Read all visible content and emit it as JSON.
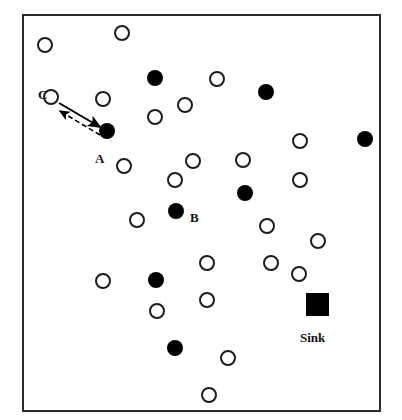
{
  "figure": {
    "kind": "sensor-network-diagram",
    "background_color": "#ffffff",
    "border_color": "#2b2b2b",
    "field": {
      "x": 22,
      "y": 14,
      "width": 359,
      "height": 398
    }
  },
  "legend_text": {
    "label_a": "A",
    "label_b": "B",
    "label_c": "C",
    "label_sink": "Sink"
  },
  "colors": {
    "sensor_fill": "#ffffff",
    "sensor_stroke": "#1c1c1c",
    "source_fill": "#000000",
    "sink_fill": "#000000",
    "link_solid": "#000000",
    "link_dashed": "#000000"
  },
  "chart_data": {
    "type": "scatter",
    "title": "",
    "xlabel": "",
    "ylabel": "",
    "xlim": [
      22,
      381
    ],
    "ylim": [
      14,
      412
    ],
    "grid": false,
    "legend_position": "none",
    "series": [
      {
        "name": "sensor-node",
        "marker": "open-circle",
        "radius": 8,
        "fill": "#ffffff",
        "stroke": "#1c1c1c",
        "points": [
          {
            "x": 45,
            "y": 45
          },
          {
            "x": 122,
            "y": 33
          },
          {
            "x": 51,
            "y": 97
          },
          {
            "x": 103,
            "y": 99
          },
          {
            "x": 155,
            "y": 117
          },
          {
            "x": 185,
            "y": 105
          },
          {
            "x": 217,
            "y": 79
          },
          {
            "x": 300,
            "y": 141
          },
          {
            "x": 124,
            "y": 166
          },
          {
            "x": 193,
            "y": 161
          },
          {
            "x": 243,
            "y": 160
          },
          {
            "x": 175,
            "y": 180
          },
          {
            "x": 300,
            "y": 180
          },
          {
            "x": 137,
            "y": 220
          },
          {
            "x": 267,
            "y": 226
          },
          {
            "x": 318,
            "y": 241
          },
          {
            "x": 207,
            "y": 263
          },
          {
            "x": 271,
            "y": 263
          },
          {
            "x": 299,
            "y": 274
          },
          {
            "x": 103,
            "y": 281
          },
          {
            "x": 157,
            "y": 311
          },
          {
            "x": 207,
            "y": 300
          },
          {
            "x": 228,
            "y": 358
          },
          {
            "x": 209,
            "y": 395
          }
        ]
      },
      {
        "name": "source-node",
        "marker": "filled-circle",
        "radius": 8,
        "fill": "#000000",
        "points": [
          {
            "x": 155,
            "y": 78
          },
          {
            "x": 266,
            "y": 92
          },
          {
            "x": 107,
            "y": 131
          },
          {
            "x": 365,
            "y": 139
          },
          {
            "x": 245,
            "y": 193
          },
          {
            "x": 176,
            "y": 211
          },
          {
            "x": 156,
            "y": 280
          },
          {
            "x": 175,
            "y": 348
          }
        ]
      },
      {
        "name": "sink-node",
        "marker": "filled-square",
        "size": 23,
        "fill": "#000000",
        "points": [
          {
            "x": 317,
            "y": 304
          }
        ]
      }
    ],
    "annotations": [
      {
        "text": "C",
        "x": 38,
        "y": 88,
        "anchor": "node-c"
      },
      {
        "text": "A",
        "x": 95,
        "y": 152,
        "anchor": "node-a"
      },
      {
        "text": "B",
        "x": 190,
        "y": 211,
        "anchor": "node-b"
      },
      {
        "text": "Sink",
        "x": 317,
        "y": 330,
        "anchor": "sink-node"
      }
    ],
    "links": [
      {
        "name": "link-c-to-a",
        "style": "solid",
        "arrow": "end",
        "from": {
          "x": 59,
          "y": 103
        },
        "to": {
          "x": 100,
          "y": 127
        }
      },
      {
        "name": "link-a-to-c",
        "style": "dashed",
        "arrow": "end",
        "from": {
          "x": 100,
          "y": 135
        },
        "to": {
          "x": 60,
          "y": 111
        }
      }
    ]
  }
}
